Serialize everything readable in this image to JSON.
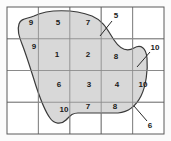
{
  "figure": {
    "type": "grid-overlay-region",
    "title": "",
    "canvas": {
      "width": 171,
      "height": 141
    },
    "background_color": "#fbfbfb",
    "frame": {
      "x": 7,
      "y": 7,
      "width": 157,
      "height": 127,
      "stroke_color": "#5a5a5a",
      "stroke_width": 1
    },
    "grid": {
      "columns": 5,
      "rows": 4,
      "x_lines": [
        7,
        38.4,
        69.8,
        101.2,
        132.6,
        164
      ],
      "y_lines": [
        7,
        38.75,
        70.5,
        102.25,
        134
      ],
      "stroke_color": "#8a8a8a",
      "stroke_width": 1
    },
    "region": {
      "name": "shaded-region",
      "fill_color": "#d8d8d8",
      "stroke_color": "#3a3a3a",
      "stroke_width": 1.2,
      "path": "M 34,16 C 48,9 74,9 92,16 C 104,21 108,31 114,40 C 120,49 127,52 134,48 C 141,44 146,48 147,58 C 148,70 146,86 141,96 C 136,106 128,112 118,113 L 78,113 C 72,113 70,116 66,120 C 61,125 54,124 50,118 C 44,110 40,98 36,86 C 31,70 26,54 22,44 C 19,36 17,30 19,24 C 21,18 27,19 34,16 Z"
    },
    "cell_numbers": [
      {
        "label": "9",
        "x": 31,
        "y": 23
      },
      {
        "label": "5",
        "x": 58,
        "y": 23
      },
      {
        "label": "7",
        "x": 88,
        "y": 23
      },
      {
        "label": "9",
        "x": 34,
        "y": 47
      },
      {
        "label": "1",
        "x": 57,
        "y": 55
      },
      {
        "label": "2",
        "x": 88,
        "y": 55
      },
      {
        "label": "8",
        "x": 116,
        "y": 57
      },
      {
        "label": "6",
        "x": 59,
        "y": 85
      },
      {
        "label": "3",
        "x": 89,
        "y": 85
      },
      {
        "label": "4",
        "x": 117,
        "y": 85
      },
      {
        "label": "10",
        "x": 143,
        "y": 85
      },
      {
        "label": "10",
        "x": 64,
        "y": 110
      },
      {
        "label": "7",
        "x": 88,
        "y": 107
      },
      {
        "label": "8",
        "x": 115,
        "y": 107
      }
    ],
    "callouts": [
      {
        "label": "5",
        "label_x": 116,
        "label_y": 16,
        "leader": {
          "x1": 112,
          "y1": 21,
          "x2": 100,
          "y2": 36
        }
      },
      {
        "label": "10",
        "label_x": 155,
        "label_y": 48,
        "leader": {
          "x1": 150,
          "y1": 52,
          "x2": 137,
          "y2": 67
        }
      },
      {
        "label": "6",
        "label_x": 150,
        "label_y": 126,
        "leader": {
          "x1": 147,
          "y1": 121,
          "x2": 134,
          "y2": 106
        }
      }
    ]
  }
}
